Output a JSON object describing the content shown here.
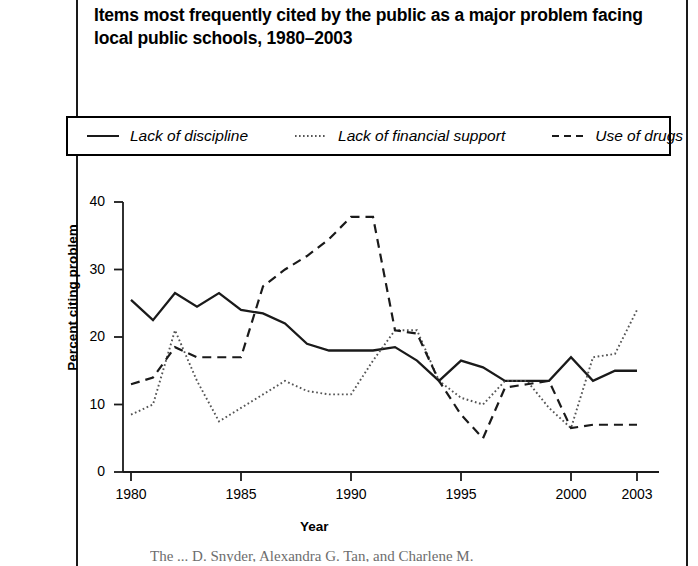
{
  "title": "Items most frequently cited by the public as a major problem facing local public schools, 1980–2003",
  "legend": {
    "position": "top",
    "items": [
      {
        "label": "Lack of discipline",
        "style": "solid",
        "color": "#1a1a1a"
      },
      {
        "label": "Lack of financial support",
        "style": "dotted",
        "color": "#555555"
      },
      {
        "label": "Use of drugs",
        "style": "dashed",
        "color": "#1a1a1a"
      }
    ]
  },
  "footer_partial_text": "The ... D. Snyder, Alexandra G. Tan, and Charlene M.",
  "chart_data": {
    "type": "line",
    "title": "Items most frequently cited by the public as a major problem facing local public schools, 1980–2003",
    "xlabel": "Year",
    "ylabel": "Percent citing problem",
    "xlim": [
      1980,
      2003
    ],
    "ylim": [
      0,
      40
    ],
    "grid": false,
    "legend_position": "top",
    "xticks": [
      1980,
      1985,
      1990,
      1995,
      2000,
      2003
    ],
    "xtick_labels": [
      "1980",
      "1985",
      "1990",
      "1995",
      "2000",
      "2003"
    ],
    "yticks": [
      0,
      10,
      20,
      30,
      40
    ],
    "ytick_labels": [
      "0",
      "10",
      "20",
      "30",
      "40"
    ],
    "x": [
      1980,
      1981,
      1982,
      1983,
      1984,
      1985,
      1986,
      1987,
      1988,
      1989,
      1990,
      1991,
      1992,
      1993,
      1994,
      1995,
      1996,
      1997,
      1998,
      1999,
      2000,
      2001,
      2002,
      2003
    ],
    "series": [
      {
        "name": "Lack of discipline",
        "style": "solid",
        "color": "#1a1a1a",
        "values": [
          25.5,
          22.5,
          26.5,
          24.5,
          26.5,
          24.0,
          23.5,
          22.0,
          19.0,
          18.0,
          18.0,
          18.0,
          18.5,
          16.5,
          13.5,
          16.5,
          15.5,
          13.5,
          13.5,
          13.5,
          17.0,
          13.5,
          15.0,
          15.0
        ]
      },
      {
        "name": "Lack of financial support",
        "style": "dotted",
        "color": "#555555",
        "values": [
          8.5,
          10.0,
          21.0,
          13.5,
          7.5,
          9.5,
          11.5,
          13.5,
          12.0,
          11.5,
          11.5,
          16.5,
          21.0,
          21.0,
          13.5,
          11.0,
          10.0,
          13.5,
          13.5,
          9.5,
          6.5,
          17.0,
          17.5,
          24.0
        ]
      },
      {
        "name": "Use of drugs",
        "style": "dashed",
        "color": "#1a1a1a",
        "values": [
          13.0,
          14.0,
          18.5,
          17.0,
          17.0,
          17.0,
          27.5,
          30.0,
          32.0,
          34.5,
          37.8,
          37.8,
          21.0,
          20.5,
          13.5,
          8.5,
          5.0,
          12.5,
          13.0,
          13.5,
          6.5,
          7.0,
          7.0,
          7.0
        ]
      }
    ]
  },
  "axes_geometry": {
    "x_pixel_1980": 131,
    "x_pixel_2003": 637,
    "y_pixel_0": 472,
    "y_pixel_40": 202
  }
}
